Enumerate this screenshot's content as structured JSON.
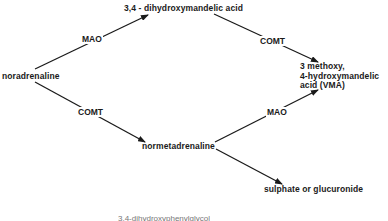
{
  "nodes": {
    "noradrenaline": "noradrenaline",
    "dhma": "3,4 - dihydroxymandelic acid",
    "vma_line1": "3 methoxy,",
    "vma_line2": "4-hydroxymandelic",
    "vma_line3": "acid (VMA)",
    "normetadrenaline": "normetadrenaline",
    "conjugates": "sulphate or glucuronide"
  },
  "enzymes": {
    "mao_top": "MAO",
    "comt_top": "COMT",
    "comt_bottom": "COMT",
    "mao_bottom": "MAO"
  },
  "caption": "3,4-dihydroxyphenylglycol",
  "colors": {
    "line": "#1a1a1a",
    "text": "#1a1a1a"
  }
}
